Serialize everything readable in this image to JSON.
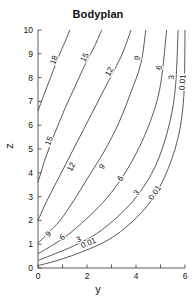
{
  "chart_data": {
    "type": "line",
    "title": "Bodyplan",
    "xlabel": "y",
    "ylabel": "z",
    "xlim": [
      0,
      6
    ],
    "ylim": [
      0,
      10
    ],
    "xticks": [
      0,
      1,
      2,
      3,
      4,
      5,
      6
    ],
    "xtick_labels": [
      "0",
      "",
      "2",
      "",
      "4",
      "",
      "6"
    ],
    "yticks": [
      0,
      1,
      2,
      3,
      4,
      5,
      6,
      7,
      8,
      9,
      10
    ],
    "ytick_labels": [
      "0",
      "1",
      "2",
      "3",
      "4",
      "5",
      "6",
      "7",
      "8",
      "9",
      "10"
    ],
    "grid": false,
    "legend": "none",
    "contours": [
      {
        "level": "18",
        "label": "18",
        "points": [
          [
            0.0,
            6.6
          ],
          [
            0.25,
            7.3
          ],
          [
            0.55,
            8.1
          ],
          [
            0.85,
            8.9
          ],
          [
            1.1,
            9.5
          ],
          [
            1.3,
            10.0
          ]
        ],
        "label_positions": [
          [
            0.75,
            8.7
          ]
        ]
      },
      {
        "level": "15",
        "label": "15",
        "points": [
          [
            0.0,
            3.6
          ],
          [
            0.3,
            4.6
          ],
          [
            0.7,
            5.7
          ],
          [
            1.1,
            6.7
          ],
          [
            1.5,
            7.6
          ],
          [
            1.9,
            8.5
          ],
          [
            2.3,
            9.3
          ],
          [
            2.6,
            10.0
          ]
        ],
        "label_positions": [
          [
            0.55,
            5.3
          ],
          [
            2.0,
            8.8
          ]
        ]
      },
      {
        "level": "12",
        "label": "12",
        "points": [
          [
            0.0,
            2.0
          ],
          [
            0.4,
            2.9
          ],
          [
            0.9,
            3.9
          ],
          [
            1.4,
            4.9
          ],
          [
            1.9,
            5.9
          ],
          [
            2.4,
            6.9
          ],
          [
            2.9,
            7.9
          ],
          [
            3.4,
            8.9
          ],
          [
            3.8,
            10.0
          ]
        ],
        "label_positions": [
          [
            1.45,
            4.2
          ],
          [
            3.0,
            8.2
          ]
        ]
      },
      {
        "level": "9",
        "label": "9",
        "points": [
          [
            0.0,
            1.05
          ],
          [
            0.35,
            1.4
          ],
          [
            0.9,
            2.0
          ],
          [
            1.5,
            2.9
          ],
          [
            2.1,
            3.9
          ],
          [
            2.7,
            4.9
          ],
          [
            3.3,
            6.1
          ],
          [
            3.8,
            7.4
          ],
          [
            4.2,
            8.6
          ],
          [
            4.4,
            10.0
          ]
        ],
        "label_positions": [
          [
            0.5,
            1.35
          ],
          [
            2.7,
            4.2
          ],
          [
            4.15,
            8.8
          ]
        ]
      },
      {
        "level": "6",
        "label": "6",
        "points": [
          [
            0.0,
            0.6
          ],
          [
            0.5,
            0.9
          ],
          [
            1.1,
            1.3
          ],
          [
            1.8,
            1.9
          ],
          [
            2.6,
            2.7
          ],
          [
            3.3,
            3.6
          ],
          [
            4.0,
            4.8
          ],
          [
            4.6,
            6.2
          ],
          [
            5.0,
            7.7
          ],
          [
            5.25,
            10.0
          ]
        ],
        "label_positions": [
          [
            1.05,
            1.2
          ],
          [
            3.45,
            3.7
          ],
          [
            5.05,
            8.4
          ]
        ]
      },
      {
        "level": "3",
        "label": "3",
        "points": [
          [
            0.0,
            0.32
          ],
          [
            0.7,
            0.6
          ],
          [
            1.5,
            0.95
          ],
          [
            2.4,
            1.45
          ],
          [
            3.3,
            2.2
          ],
          [
            4.1,
            3.1
          ],
          [
            4.8,
            4.3
          ],
          [
            5.3,
            5.8
          ],
          [
            5.6,
            7.5
          ],
          [
            5.72,
            10.0
          ]
        ],
        "label_positions": [
          [
            1.7,
            1.1
          ],
          [
            4.1,
            3.1
          ],
          [
            5.55,
            8.0
          ]
        ]
      },
      {
        "level": "0.01",
        "label": "0.01",
        "points": [
          [
            0.0,
            0.1
          ],
          [
            0.9,
            0.35
          ],
          [
            1.9,
            0.72
          ],
          [
            2.9,
            1.2
          ],
          [
            3.8,
            1.9
          ],
          [
            4.6,
            2.8
          ],
          [
            5.2,
            3.9
          ],
          [
            5.7,
            5.4
          ],
          [
            5.95,
            7.2
          ],
          [
            6.0,
            10.0
          ]
        ],
        "label_positions": [
          [
            2.1,
            0.95
          ],
          [
            4.85,
            3.1
          ],
          [
            6.0,
            7.8
          ]
        ]
      }
    ]
  },
  "figure": {
    "title": "Bodyplan",
    "xlabel": "y",
    "ylabel": "z"
  },
  "colors": {
    "background": "#ffffff",
    "axis": "#4a4a4a",
    "contour_line": "#3a3a3a",
    "text": "#111111"
  }
}
